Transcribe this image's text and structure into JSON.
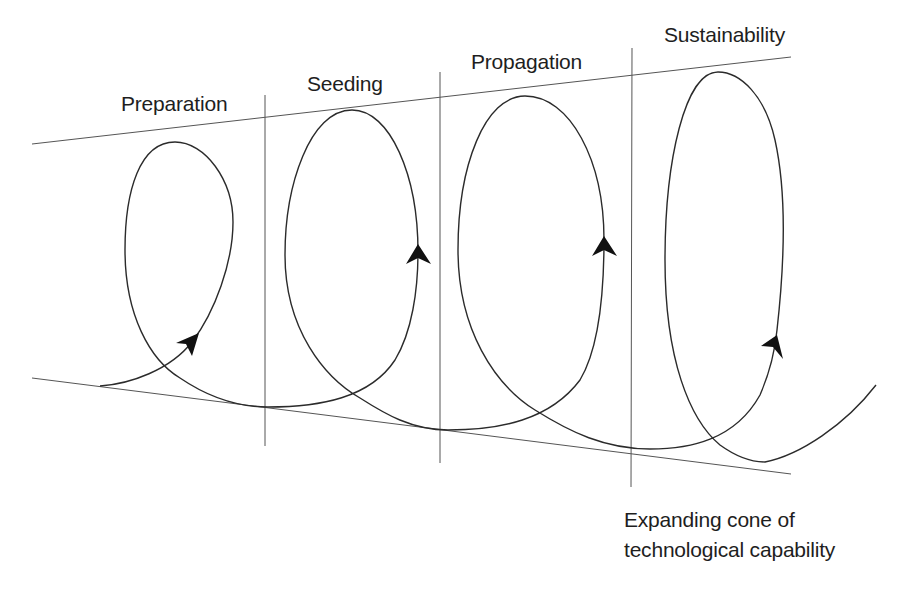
{
  "diagram": {
    "type": "expanding-spiral",
    "phases": [
      {
        "label": "Preparation"
      },
      {
        "label": "Seeding"
      },
      {
        "label": "Propagation"
      },
      {
        "label": "Sustainability"
      }
    ],
    "caption": {
      "line1": "Expanding cone of",
      "line2": "technological capability"
    },
    "colors": {
      "stroke": "#2b2b2b",
      "guide": "#555555",
      "text": "#1e1e1e",
      "background": "#ffffff"
    },
    "icons": [
      "arrowhead-icon"
    ]
  }
}
